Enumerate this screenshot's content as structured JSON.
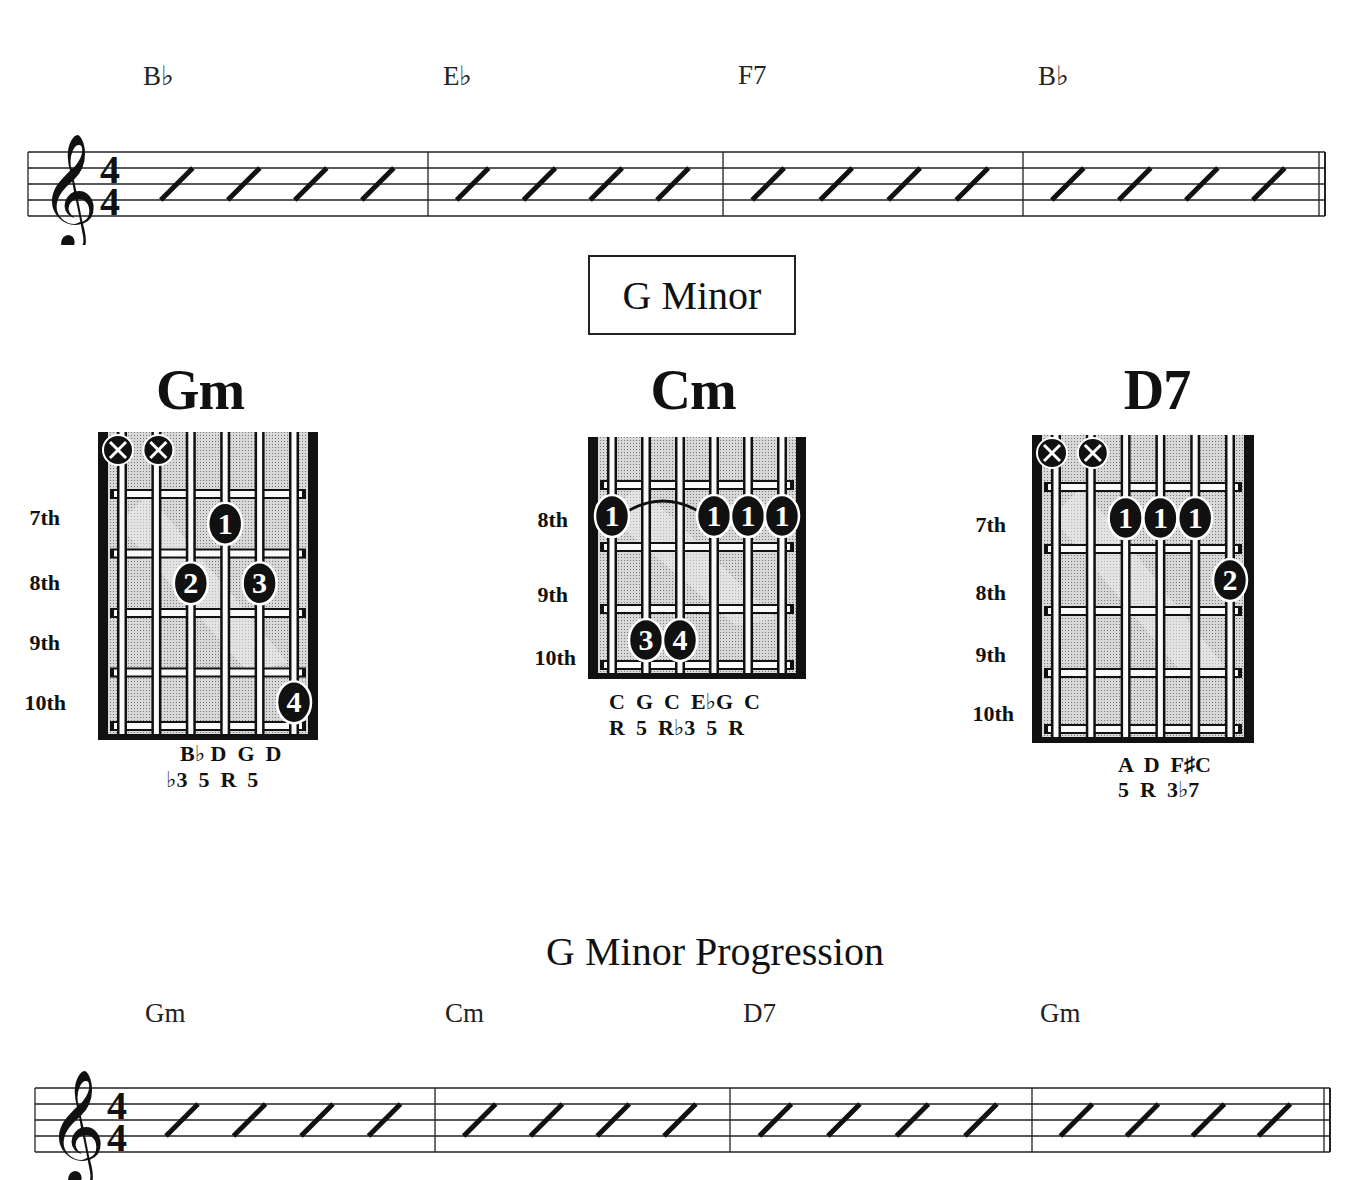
{
  "top_progression": {
    "chords": [
      "B♭",
      "E♭",
      "F7",
      "B♭"
    ],
    "time_signature": {
      "top": "4",
      "bottom": "4"
    },
    "beats_per_measure": 4
  },
  "section": {
    "title": "G Minor"
  },
  "chords": [
    {
      "name": "Gm",
      "fret_labels": [
        "7th",
        "8th",
        "9th",
        "10th"
      ],
      "muted_strings": [
        1,
        2
      ],
      "fingers": [
        {
          "string": 4,
          "fret": 1,
          "finger": "1"
        },
        {
          "string": 3,
          "fret": 2,
          "finger": "2"
        },
        {
          "string": 5,
          "fret": 2,
          "finger": "3"
        },
        {
          "string": 6,
          "fret": 4,
          "finger": "4"
        }
      ],
      "notes": "B♭ D  G  D",
      "intervals": "♭3  5  R  5"
    },
    {
      "name": "Cm",
      "fret_labels": [
        "8th",
        "9th",
        "10th"
      ],
      "muted_strings": [],
      "barre": {
        "from": 1,
        "to": 4,
        "fret": 1
      },
      "fingers": [
        {
          "string": 1,
          "fret": 1,
          "finger": "1"
        },
        {
          "string": 4,
          "fret": 1,
          "finger": "1"
        },
        {
          "string": 5,
          "fret": 1,
          "finger": "1"
        },
        {
          "string": 6,
          "fret": 1,
          "finger": "1"
        },
        {
          "string": 2,
          "fret": 3,
          "finger": "3"
        },
        {
          "string": 3,
          "fret": 3,
          "finger": "4"
        }
      ],
      "notes": "C  G  C  E♭G  C",
      "intervals": "R  5  R♭3  5  R"
    },
    {
      "name": "D7",
      "fret_labels": [
        "7th",
        "8th",
        "9th",
        "10th"
      ],
      "muted_strings": [
        1,
        2
      ],
      "fingers": [
        {
          "string": 3,
          "fret": 1,
          "finger": "1"
        },
        {
          "string": 4,
          "fret": 1,
          "finger": "1"
        },
        {
          "string": 5,
          "fret": 1,
          "finger": "1"
        },
        {
          "string": 6,
          "fret": 2,
          "finger": "2"
        }
      ],
      "notes": "A  D  F♯C",
      "intervals": "5  R  3♭7"
    }
  ],
  "progression": {
    "title": "G Minor Progression",
    "chords": [
      "Gm",
      "Cm",
      "D7",
      "Gm"
    ],
    "time_signature": {
      "top": "4",
      "bottom": "4"
    },
    "beats_per_measure": 4
  },
  "icons": {
    "muted": "x-circle-icon",
    "clef": "treble-clef-icon",
    "slash": "slash-beat-icon"
  },
  "colors": {
    "ink": "#111111",
    "fret_fill": "#bdbdbd",
    "paper": "#ffffff"
  }
}
